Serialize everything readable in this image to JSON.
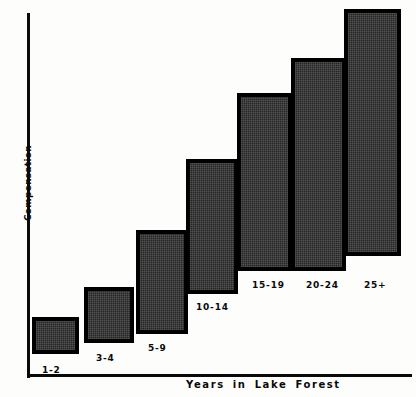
{
  "chart_data": {
    "type": "bar",
    "title": "",
    "xlabel": "Years in Lake Forest",
    "ylabel": "Compensation",
    "categories": [
      "1-2",
      "3-4",
      "5-9",
      "10-14",
      "15-19",
      "20-24",
      "25+"
    ],
    "values": [
      9,
      23,
      42,
      61,
      79,
      88,
      100
    ],
    "ylim": [
      0,
      100
    ],
    "grid": false,
    "legend": null,
    "series": [
      {
        "name": "Compensation",
        "values": [
          9,
          23,
          42,
          61,
          79,
          88,
          100
        ]
      }
    ]
  },
  "bars": [
    {
      "label": "1-2",
      "left": 32,
      "top": 317,
      "width": 47,
      "height": 37,
      "label_left": 42,
      "label_top": 365
    },
    {
      "label": "3-4",
      "left": 84,
      "top": 287,
      "width": 50,
      "height": 56,
      "label_left": 96,
      "label_top": 353
    },
    {
      "label": "5-9",
      "left": 136,
      "top": 230,
      "width": 52,
      "height": 104,
      "label_left": 148,
      "label_top": 343
    },
    {
      "label": "10-14",
      "left": 186,
      "top": 159,
      "width": 52,
      "height": 135,
      "label_left": 196,
      "label_top": 302
    },
    {
      "label": "15-19",
      "left": 237,
      "top": 93,
      "width": 55,
      "height": 178,
      "label_left": 252,
      "label_top": 280
    },
    {
      "label": "20-24",
      "left": 291,
      "top": 58,
      "width": 55,
      "height": 213,
      "label_left": 306,
      "label_top": 280
    },
    {
      "label": "25+",
      "left": 344,
      "top": 9,
      "width": 57,
      "height": 247,
      "label_left": 364,
      "label_top": 280
    }
  ],
  "axes": {
    "y_title": "Compensation",
    "x_title": "Years in Lake Forest"
  }
}
